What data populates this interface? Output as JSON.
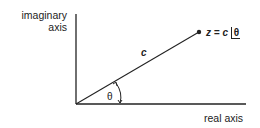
{
  "diagram": {
    "y_axis_label_line1": "imaginary",
    "y_axis_label_line2": "axis",
    "x_axis_label": "real axis",
    "vector_label": "c",
    "point_label_prefix": "z = c ",
    "point_label_angle": "θ",
    "angle_label": "θ",
    "colors": {
      "ink": "#222222",
      "background": "#ffffff"
    }
  }
}
